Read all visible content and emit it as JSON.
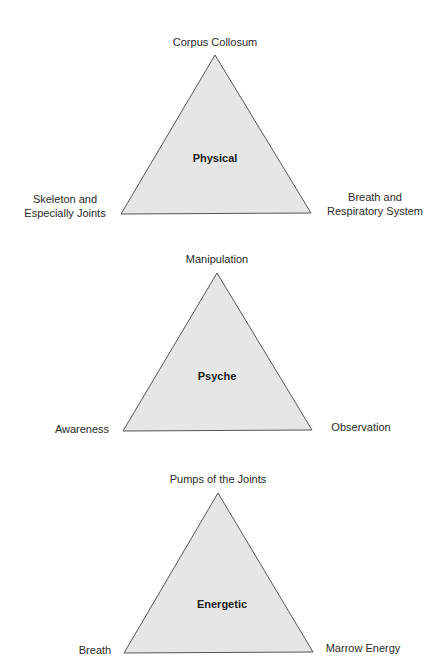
{
  "diagrams": [
    {
      "center": "Physical",
      "top": "Corpus Collosum",
      "left_line1": "Skeleton and",
      "left_line2": "Especially Joints",
      "right_line1": "Breath and",
      "right_line2": "Respiratory System"
    },
    {
      "center": "Psyche",
      "top": "Manipulation",
      "left": "Awareness",
      "right": "Observation"
    },
    {
      "center": "Energetic",
      "top": "Pumps of the Joints",
      "left": "Breath",
      "right": "Marrow Energy"
    }
  ],
  "colors": {
    "fill": "#e6e6e6",
    "stroke": "#555555",
    "text": "#2a2a2a"
  }
}
